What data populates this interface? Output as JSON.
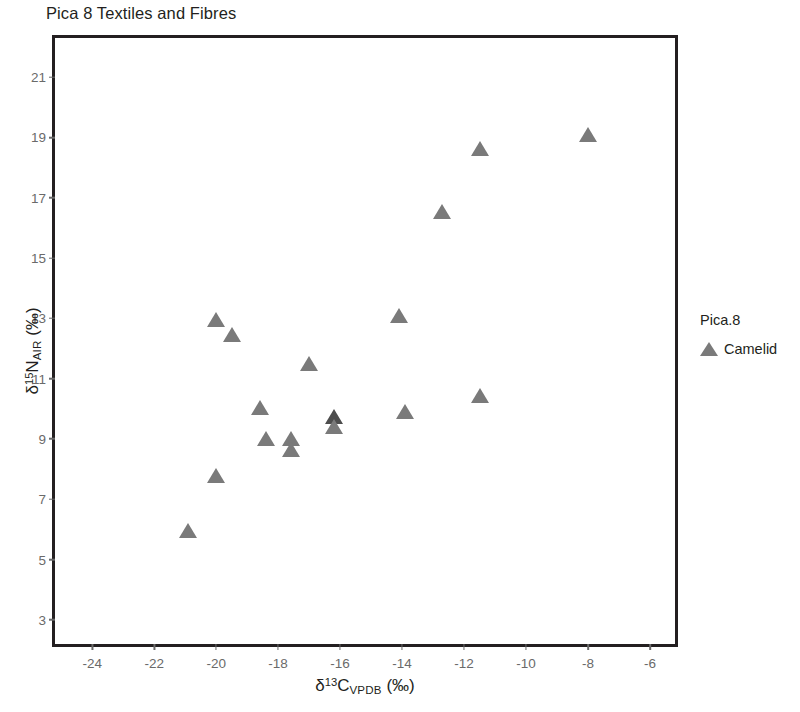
{
  "chart_data": {
    "type": "scatter",
    "title": "Pica 8 Textiles and Fibres",
    "xlabel": "δ13CVPDB (‰)",
    "ylabel": "δ15NAIR (‰)",
    "xlim": [
      -25.2,
      -5.0
    ],
    "ylim": [
      2.0,
      22.3
    ],
    "xticks": [
      -24,
      -22,
      -20,
      -18,
      -16,
      -14,
      -12,
      -10,
      -8,
      -6
    ],
    "yticks": [
      3,
      5,
      7,
      9,
      11,
      13,
      15,
      17,
      19,
      21
    ],
    "xtick_labels": [
      "-24",
      "-22",
      "-20",
      "-18",
      "-16",
      "-14",
      "-12",
      "-10",
      "-8",
      "-6"
    ],
    "ytick_labels": [
      "3",
      "5",
      "7",
      "9",
      "11",
      "13",
      "15",
      "17",
      "19",
      "21"
    ],
    "grid": false,
    "legend_position": "right",
    "marker": "triangle-up",
    "marker_color": "#7a7a7a",
    "marker_color_overlap": "#4d4d4d",
    "series": [
      {
        "name": "Camelid",
        "color": "#7a7a7a",
        "points": [
          {
            "x": -20.9,
            "y": 5.9
          },
          {
            "x": -20.0,
            "y": 7.75
          },
          {
            "x": -20.0,
            "y": 12.9
          },
          {
            "x": -19.5,
            "y": 12.4
          },
          {
            "x": -18.6,
            "y": 10.0
          },
          {
            "x": -18.4,
            "y": 8.95
          },
          {
            "x": -17.6,
            "y": 8.95
          },
          {
            "x": -17.6,
            "y": 8.6
          },
          {
            "x": -17.0,
            "y": 11.45
          },
          {
            "x": -16.2,
            "y": 9.7,
            "overlap": true
          },
          {
            "x": -16.2,
            "y": 9.35
          },
          {
            "x": -14.1,
            "y": 13.05
          },
          {
            "x": -13.9,
            "y": 9.85
          },
          {
            "x": -12.7,
            "y": 16.5
          },
          {
            "x": -11.5,
            "y": 18.6
          },
          {
            "x": -11.5,
            "y": 10.4
          },
          {
            "x": -8.0,
            "y": 19.05
          }
        ]
      }
    ]
  },
  "legend": {
    "title": "Pica.8",
    "entries": [
      {
        "label": "Camelid",
        "color": "#7a7a7a"
      }
    ]
  }
}
